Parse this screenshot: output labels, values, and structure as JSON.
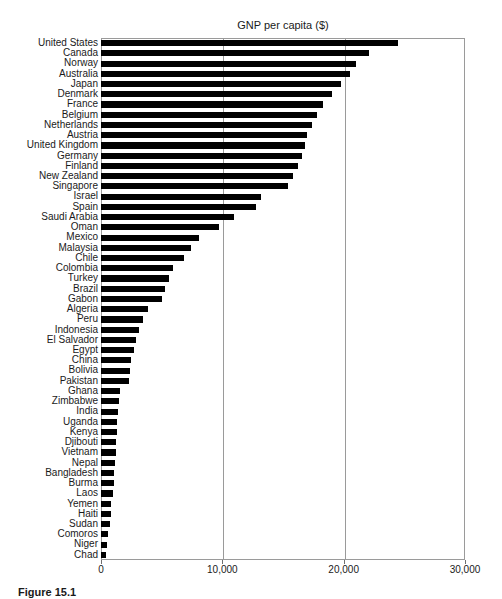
{
  "caption": "Figure 15.1",
  "chart_data": {
    "type": "bar",
    "orientation": "horizontal",
    "title": "GNP per capita ($)",
    "xlabel": "",
    "ylabel": "",
    "xlim": [
      0,
      30000
    ],
    "grid": true,
    "legend": "none",
    "xticks": [
      0,
      10000,
      20000,
      30000
    ],
    "xticklabels": [
      "0",
      "10,000",
      "20,000",
      "30,000"
    ],
    "bar_color": "#000000",
    "categories": [
      "United States",
      "Canada",
      "Norway",
      "Australia",
      "Japan",
      "Denmark",
      "France",
      "Belgium",
      "Netherlands",
      "Austria",
      "United Kingdom",
      "Germany",
      "Finland",
      "New Zealand",
      "Singapore",
      "Israel",
      "Spain",
      "Saudi Arabia",
      "Oman",
      "Mexico",
      "Malaysia",
      "Chile",
      "Colombia",
      "Turkey",
      "Brazil",
      "Gabon",
      "Algeria",
      "Peru",
      "Indonesia",
      "El Salvador",
      "Egypt",
      "China",
      "Bolivia",
      "Pakistan",
      "Ghana",
      "Zimbabwe",
      "India",
      "Uganda",
      "Kenya",
      "Djibouti",
      "Vietnam",
      "Nepal",
      "Bangladesh",
      "Burma",
      "Laos",
      "Yemen",
      "Haiti",
      "Sudan",
      "Comoros",
      "Niger",
      "Chad"
    ],
    "values": [
      24500,
      22100,
      21000,
      20500,
      19800,
      19000,
      18300,
      17800,
      17400,
      17000,
      16800,
      16600,
      16200,
      15800,
      15400,
      13200,
      12800,
      11000,
      9700,
      8100,
      7400,
      6800,
      5900,
      5600,
      5300,
      5000,
      3900,
      3500,
      3100,
      2900,
      2700,
      2500,
      2400,
      2300,
      1600,
      1500,
      1400,
      1350,
      1300,
      1250,
      1200,
      1150,
      1100,
      1050,
      1000,
      850,
      800,
      750,
      600,
      500,
      400
    ]
  }
}
